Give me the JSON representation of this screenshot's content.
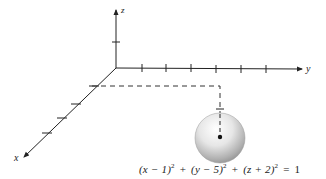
{
  "diagram": {
    "type": "3d-coordinate-axes-with-sphere",
    "axes": {
      "x_label": "x",
      "y_label": "y",
      "z_label": "z",
      "x_ticks": 4,
      "y_ticks": 6,
      "z_ticks": 1
    },
    "sphere": {
      "center": [
        1,
        5,
        -2
      ],
      "radius": 1,
      "fill_light": "#ffffff",
      "fill_dark": "#8a8a8a"
    },
    "equation": {
      "term1": "(x − 1)",
      "term2": "(y − 5)",
      "term3": "(z + 2)",
      "exp": "2",
      "plus": "+",
      "equals": "=",
      "rhs": "1"
    },
    "line_color": "#222222"
  }
}
